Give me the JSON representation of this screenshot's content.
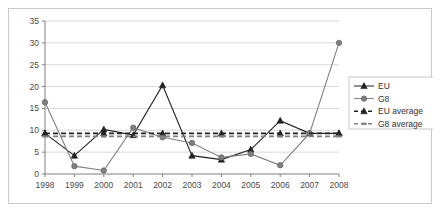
{
  "chart_data": {
    "type": "line",
    "title": "",
    "subtitle": "",
    "xlabel": "",
    "ylabel": "",
    "grid": true,
    "legend_position": "right",
    "xlim": [
      1998,
      2008
    ],
    "ylim": [
      0,
      35
    ],
    "ytick_labels": [
      "0",
      "5",
      "10",
      "15",
      "20",
      "25",
      "30",
      "35"
    ],
    "yticks": [
      0,
      5,
      10,
      15,
      20,
      25,
      30,
      35
    ],
    "categories": [
      "1998",
      "1999",
      "2000",
      "2001",
      "2002",
      "2003",
      "2004",
      "2005",
      "2006",
      "2007",
      "2008"
    ],
    "x": [
      1998,
      1999,
      2000,
      2001,
      2002,
      2003,
      2004,
      2005,
      2006,
      2007,
      2008
    ],
    "series": [
      {
        "name": "EU",
        "style": "solid",
        "marker": "triangle",
        "color": "#222222",
        "values": [
          9.3,
          4.2,
          10.2,
          8.9,
          20.3,
          4.2,
          3.3,
          5.6,
          12.2,
          9.3,
          9.3
        ]
      },
      {
        "name": "G8",
        "style": "solid",
        "marker": "circle",
        "color": "#808080",
        "values": [
          16.4,
          1.8,
          0.8,
          10.6,
          8.4,
          7.1,
          3.8,
          4.6,
          2.0,
          9.3,
          30.0
        ]
      },
      {
        "name": "EU average",
        "style": "dashed",
        "marker": "triangle",
        "color": "#222222",
        "constant": 9.3,
        "values": [
          9.3,
          9.3,
          9.3,
          9.3,
          9.3,
          9.3,
          9.3,
          9.3,
          9.3,
          9.3,
          9.3
        ]
      },
      {
        "name": "G8 average",
        "style": "dashed",
        "marker": "dash",
        "color": "#808080",
        "constant": 8.6,
        "values": [
          8.6,
          8.6,
          8.6,
          8.6,
          8.6,
          8.6,
          8.6,
          8.6,
          8.6,
          8.6,
          8.6
        ]
      }
    ]
  },
  "legend": {
    "items": [
      {
        "label": "EU"
      },
      {
        "label": "G8"
      },
      {
        "label": "EU average"
      },
      {
        "label": "G8 average"
      }
    ]
  },
  "colors": {
    "eu": "#222222",
    "g8": "#808080",
    "grid": "#d8d8d8",
    "axis": "#808080",
    "frame": "#c9c9c9",
    "text": "#4a4a4a"
  }
}
